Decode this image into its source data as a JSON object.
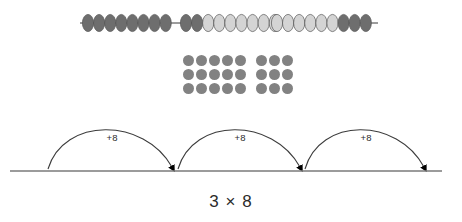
{
  "diagram": {
    "expression": "3 × 8",
    "colors": {
      "bead_dark": "#6e6e6e",
      "bead_light": "#d4d4d4",
      "bead_outline": "#555555",
      "dot": "#828282",
      "rod": "#3a3a3a",
      "number_line": "#7a7a7a",
      "arc": "#3c3c3c",
      "arrow": "#000000",
      "text": "#2b2b2b"
    }
  },
  "bead_string": {
    "name": "bead-string",
    "rod": {
      "x1": 80,
      "x2": 378,
      "y": 23
    },
    "total_beads": 26,
    "groups": [
      {
        "label": "group-1",
        "beads": [
          {
            "shade": "dark"
          },
          {
            "shade": "dark"
          },
          {
            "shade": "dark"
          },
          {
            "shade": "dark"
          },
          {
            "shade": "dark"
          },
          {
            "shade": "dark"
          },
          {
            "shade": "dark"
          },
          {
            "shade": "dark"
          }
        ],
        "start_x": 88
      },
      {
        "label": "group-2",
        "beads": [
          {
            "shade": "dark"
          },
          {
            "shade": "dark"
          },
          {
            "shade": "light"
          },
          {
            "shade": "light"
          },
          {
            "shade": "light"
          },
          {
            "shade": "light"
          },
          {
            "shade": "light"
          },
          {
            "shade": "light"
          },
          {
            "shade": "light"
          }
        ],
        "start_x": 186
      },
      {
        "label": "group-3",
        "beads": [
          {
            "shade": "light"
          },
          {
            "shade": "light"
          },
          {
            "shade": "light"
          },
          {
            "shade": "light"
          },
          {
            "shade": "light"
          },
          {
            "shade": "light"
          },
          {
            "shade": "dark"
          },
          {
            "shade": "dark"
          },
          {
            "shade": "dark"
          }
        ],
        "start_x": 277
      }
    ]
  },
  "dot_array": {
    "name": "dot-array",
    "rows": 3,
    "columns": 8,
    "split_after_column": 5,
    "total_dots": 24,
    "row_pattern": [
      1,
      1,
      1,
      1,
      1,
      0,
      1,
      1,
      1
    ]
  },
  "number_line": {
    "name": "number-line",
    "line": {
      "x1": 10,
      "x2": 442,
      "y": 68
    },
    "jumps": [
      {
        "label": "+8",
        "label_x": 112,
        "label_y": 38,
        "start_x": 48,
        "end_x": 172,
        "apex_y": 14
      },
      {
        "label": "+8",
        "label_x": 240,
        "label_y": 38,
        "start_x": 178,
        "end_x": 300,
        "apex_y": 14
      },
      {
        "label": "+8",
        "label_x": 366,
        "label_y": 38,
        "start_x": 305,
        "end_x": 424,
        "apex_y": 14
      }
    ]
  },
  "chart_data": {
    "type": "diagram",
    "title": "3 × 8",
    "representations": [
      {
        "name": "bead string",
        "groups_of": 8,
        "number_of_groups": 3,
        "sequence": [
          "dark",
          "dark",
          "dark",
          "dark",
          "dark",
          "dark",
          "dark",
          "dark",
          "dark",
          "dark",
          "light",
          "light",
          "light",
          "light",
          "light",
          "light",
          "light",
          "light",
          "light",
          "light",
          "light",
          "light",
          "light",
          "dark",
          "dark",
          "dark"
        ]
      },
      {
        "name": "dot array",
        "rows": 3,
        "columns": 8,
        "total": 24
      },
      {
        "name": "number line jumps",
        "jump_size": 8,
        "jump_count": 3,
        "labels": [
          "+8",
          "+8",
          "+8"
        ],
        "total": 24
      }
    ]
  }
}
